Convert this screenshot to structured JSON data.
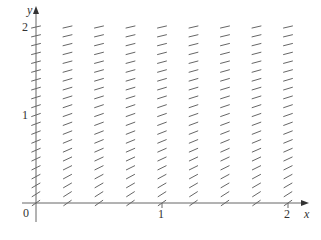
{
  "chart_data": {
    "type": "slope_field",
    "title": "",
    "xlabel": "x",
    "ylabel": "y",
    "xlim": [
      0,
      2
    ],
    "ylim": [
      0,
      2
    ],
    "x_ticks": [
      "0",
      "1",
      "2"
    ],
    "y_ticks": [
      "1",
      "2"
    ],
    "origin_label": "0",
    "grid": false,
    "columns_x": [
      0,
      0.25,
      0.5,
      0.75,
      1.0,
      1.25,
      1.5,
      1.75,
      2.0
    ],
    "rows_y": [
      0,
      0.1,
      0.2,
      0.3,
      0.4,
      0.5,
      0.6,
      0.7,
      0.8,
      0.9,
      1.0,
      1.1,
      1.2,
      1.3,
      1.4,
      1.5,
      1.6,
      1.7,
      1.8,
      1.9,
      2.0
    ],
    "slope_description": "slope depends only on y; approx 1 at y=0 decreasing to approx 0.33 at y=2",
    "slope_by_row": [
      1.0,
      0.91,
      0.83,
      0.77,
      0.71,
      0.67,
      0.63,
      0.59,
      0.56,
      0.53,
      0.5,
      0.48,
      0.45,
      0.43,
      0.42,
      0.4,
      0.38,
      0.37,
      0.36,
      0.34,
      0.33
    ]
  },
  "labels": {
    "x_axis": "x",
    "y_axis": "y",
    "origin": "0",
    "x1": "1",
    "x2": "2",
    "y1": "1",
    "y2": "2"
  },
  "colors": {
    "axis": "#555555",
    "segment": "#666666",
    "text": "#333333"
  }
}
